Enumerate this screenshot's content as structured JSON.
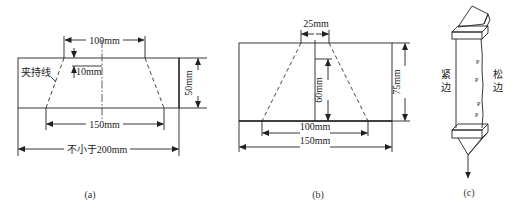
{
  "figure_a": {
    "caption": "(a)",
    "label_clamp_line": "夹持线",
    "dim_top_width": "100mm",
    "dim_notch_depth": "10mm",
    "dim_height": "50mm",
    "dim_bottom_width": "150mm",
    "dim_total_length": "不小于200mm"
  },
  "figure_b": {
    "caption": "(b)",
    "dim_top_width": "25mm",
    "dim_cut_depth": "60mm",
    "dim_height": "75mm",
    "dim_bottom_width": "100mm",
    "dim_total_width": "150mm"
  },
  "figure_c": {
    "caption": "(c)",
    "label_tight_edge": "紧边",
    "label_loose_edge": "松边"
  }
}
